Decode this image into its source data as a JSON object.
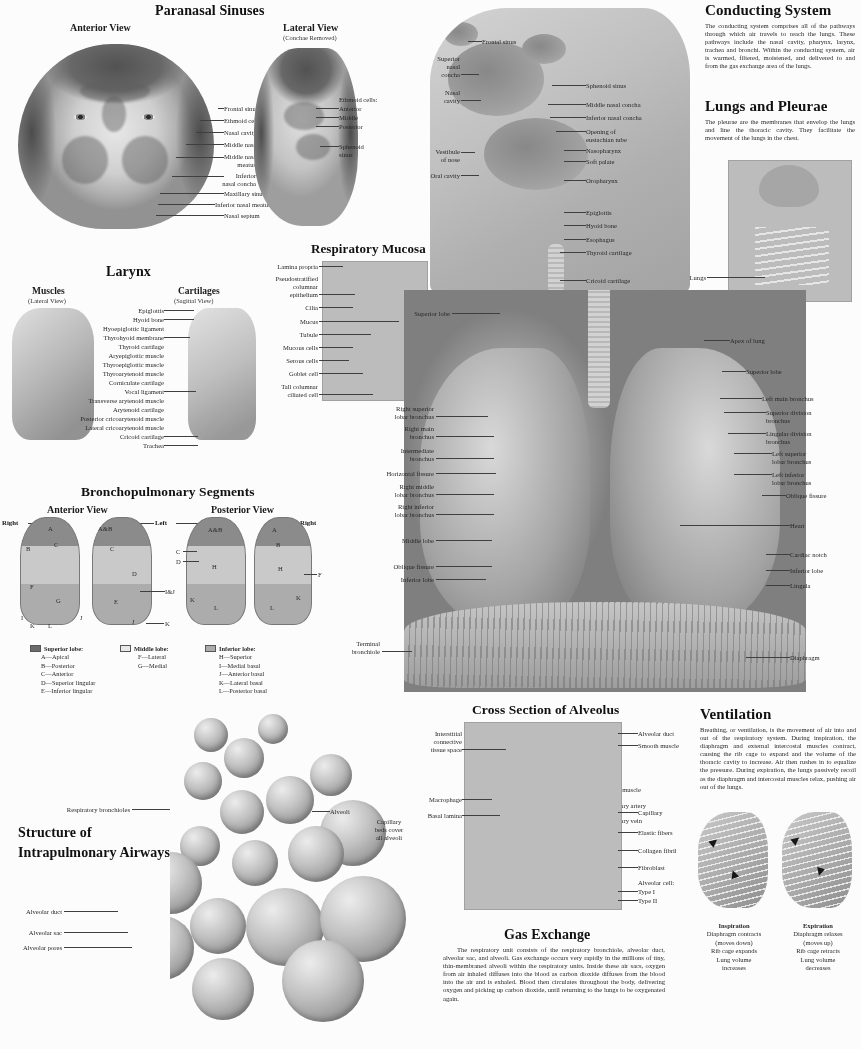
{
  "poster": {
    "title_clipped": "The Respiratory System",
    "width": 861,
    "height": 1049
  },
  "paranasal": {
    "title": "Paranasal Sinuses",
    "anterior_view": "Anterior View",
    "lateral_view": "Lateral View",
    "lateral_note": "(Conchae Removed)",
    "anterior_labels": [
      "Frontal sinus",
      "Ethmoid cells",
      "Nasal cavity",
      "Middle nasal concha",
      "Middle nasal",
      "meatus",
      "Inferior",
      "nasal concha",
      "Maxillary sinus",
      "Inferior nasal meatus",
      "Nasal septum"
    ],
    "lateral_labels": [
      "Ethmoid cells:",
      "Anterior",
      "Middle",
      "Posterior",
      "Sphenoid",
      "sinus"
    ]
  },
  "head_section": {
    "labels_left": [
      "Superior",
      "nasal",
      "concha",
      "Nasal",
      "cavity",
      "Vestibule",
      "of nose",
      "Oral cavity"
    ],
    "labels_right": [
      "Frontal sinus",
      "Sphenoid sinus",
      "Middle nasal concha",
      "Inferior nasal concha",
      "Opening of",
      "eustachian tube",
      "Nasopharynx",
      "Soft palate",
      "Oropharynx",
      "Epiglottis",
      "Hyoid bone",
      "Esophagus",
      "Thyroid cartilage",
      "Cricoid cartilage",
      "Trachea"
    ]
  },
  "conducting_system": {
    "title": "Conducting System",
    "body": "The conducting system comprises all of the pathways through which air travels to reach the lungs. These pathways include the nasal cavity, pharynx, larynx, trachea and bronchi. Within the conducting system, air is warmed, filtered, moistened, and delivered to and from the gas exchange area of the lungs."
  },
  "lungs_pleurae": {
    "title": "Lungs and Pleurae",
    "body": "The pleurae are the membranes that envelop the lungs and line the thoracic cavity. They facilitate the movement of the lungs in the chest.",
    "labels": [
      "Lungs",
      "Pleurae"
    ]
  },
  "larynx": {
    "title": "Larynx",
    "left_heading": "Muscles",
    "left_note": "(Lateral View)",
    "right_heading": "Cartilages",
    "right_note": "(Sagittal View)",
    "labels": [
      "Epiglottis",
      "Hyoid bone",
      "Hyoepiglottic ligament",
      "Thyrohyoid membrane",
      "Thyroid cartilage",
      "Aryepiglottic muscle",
      "Thyroepiglottic muscle",
      "Thyroarytenoid muscle",
      "Corniculate cartilage",
      "Vocal ligament",
      "Transverse arytenoid muscle",
      "Arytenoid cartilage",
      "Posterior cricoarytenoid muscle",
      "Lateral cricoarytenoid muscle",
      "Cricoid cartilage",
      "Trachea"
    ]
  },
  "respiratory_mucosa": {
    "title": "Respiratory Mucosa",
    "labels": [
      "Lamina propria",
      "Pseudostratified",
      "columnar",
      "epithelium",
      "Cilia",
      "Mucus",
      "Tubule",
      "Mucous cells",
      "Serous cells",
      "Goblet cell",
      "Tall columnar",
      "ciliated cell"
    ]
  },
  "lungs_main": {
    "labels_left": [
      "Superior lobe",
      "Right superior",
      "lobar bronchus",
      "Right main",
      "bronchus",
      "Intermediate",
      "bronchus",
      "Horizontal fissure",
      "Right middle",
      "lobar bronchus",
      "Right inferior",
      "lobar bronchus",
      "Middle lobe",
      "Oblique fissure",
      "Inferior lobe",
      "Terminal",
      "bronchiole"
    ],
    "labels_right": [
      "Apex of lung",
      "Superior lobe",
      "Left main bronchus",
      "Superior division",
      "bronchus",
      "Lingular division",
      "bronchus",
      "Left superior",
      "lobar bronchus",
      "Left inferior",
      "lobar bronchus",
      "Oblique fissure",
      "Heart",
      "Cardiac notch",
      "Inferior lobe",
      "Lingula",
      "Diaphragm"
    ]
  },
  "bronchopulmonary": {
    "title": "Bronchopulmonary Segments",
    "anterior_view": "Anterior View",
    "posterior_view": "Posterior View",
    "side_labels": [
      "Right",
      "Left",
      "Right"
    ],
    "anterior_right_letters": [
      "A",
      "B",
      "C",
      "F",
      "G",
      "I",
      "J",
      "K",
      "L"
    ],
    "anterior_left_letters": [
      "A&B",
      "C",
      "D",
      "E",
      "I&J",
      "J",
      "K"
    ],
    "posterior_left_letters": [
      "A&B",
      "C",
      "D",
      "H",
      "K",
      "L"
    ],
    "posterior_right_letters": [
      "A",
      "B",
      "H",
      "F",
      "K",
      "L"
    ],
    "legend": [
      {
        "heading": "Superior lobe:",
        "swatch": "#6f6a64",
        "items": [
          "A—Apical",
          "B—Posterior",
          "C—Anterior",
          "D—Superior lingular",
          "E—Inferior lingular"
        ]
      },
      {
        "heading": "Middle lobe:",
        "swatch": "#ece9e5",
        "items": [
          "F—Lateral",
          "G—Medial"
        ]
      },
      {
        "heading": "Inferior lobe:",
        "swatch": "#b0aca7",
        "items": [
          "H—Superior",
          "I—Medial basal",
          "J—Anterior basal",
          "K—Lateral basal",
          "L—Posterior basal"
        ]
      }
    ]
  },
  "intrapulmonary": {
    "title_line1": "Structure of",
    "title_line2": "Intrapulmonary Airways",
    "labels": [
      "Smooth muscle",
      "Pulmonary artery",
      "Pulmonary vein",
      "Alveoli",
      "Capillary",
      "beds cover",
      "all alveoli",
      "Respiratory bronchioles",
      "Alveolar duct",
      "Alveolar sac",
      "Alveolar pores"
    ]
  },
  "alveolus": {
    "title": "Cross Section of Alveolus",
    "labels_left": [
      "Interstitial",
      "connective",
      "tissue space",
      "Macrophage",
      "Basal lamina"
    ],
    "labels_right": [
      "Alveolar duct",
      "Smooth muscle",
      "Capillary",
      "Elastic fibers",
      "Collagen fibril",
      "Fibroblast",
      "Alveolar cell:",
      "Type I",
      "Type II"
    ]
  },
  "gas_exchange": {
    "title": "Gas Exchange",
    "body": "The respiratory unit consists of the respiratory bronchiole, alveolar duct, alveolar sac, and alveoli. Gas exchange occurs very rapidly in the millions of tiny, thin-membraned alveoli within the respiratory units. Inside these air sacs, oxygen from air inhaled diffuses into the blood as carbon dioxide diffuses from the blood into the air and is exhaled. Blood then circulates throughout the body, delivering oxygen and picking up carbon dioxide, until returning to the lungs to be oxygenated again."
  },
  "ventilation": {
    "title": "Ventilation",
    "body": "Breathing, or ventilation, is the movement of air into and out of the respiratory system. During inspiration, the diaphragm and external intercostal muscles contract, causing the rib cage to expand and the volume of the thoracic cavity to increase. Air then rushes in to equalize the pressure. During expiration, the lungs passively recoil as the diaphragm and intercostal muscles relax, pushing air out of the lungs.",
    "inspiration": {
      "heading": "Inspiration",
      "lines": [
        "Diaphragm contracts",
        "(moves down)",
        "Rib cage expands",
        "Lung volume",
        "increases"
      ]
    },
    "expiration": {
      "heading": "Expiration",
      "lines": [
        "Diaphragm relaxes",
        "(moves up)",
        "Rib cage retracts",
        "Lung volume",
        "decreases"
      ]
    }
  },
  "colors": {
    "ink": "#1f2329",
    "leader": "#3a3f47",
    "paper": "#fcfcfc"
  }
}
